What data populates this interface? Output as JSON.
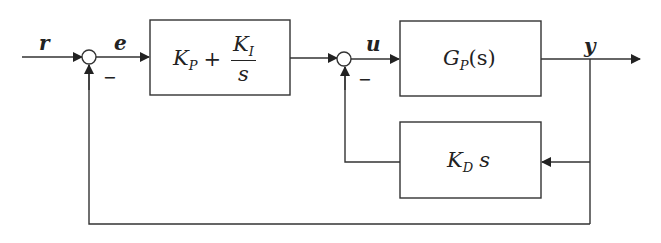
{
  "diagram": {
    "type": "block-diagram",
    "signals": {
      "reference": "r",
      "error": "e",
      "control": "u",
      "output": "y"
    },
    "summing_junctions": [
      {
        "id": "sum1",
        "sign_feedback": "−"
      },
      {
        "id": "sum2",
        "sign_feedback": "−"
      }
    ],
    "blocks": {
      "pi_controller": {
        "kp_base": "K",
        "kp_sub": "P",
        "plus": "+",
        "ki_base": "K",
        "ki_sub": "I",
        "den": "s"
      },
      "plant": {
        "base": "G",
        "sub": "P",
        "arg": "(s)"
      },
      "derivative": {
        "base": "K",
        "sub": "D",
        "var": "s"
      }
    },
    "colors": {
      "stroke": "#333333",
      "text": "#222222",
      "background": "#ffffff"
    }
  }
}
